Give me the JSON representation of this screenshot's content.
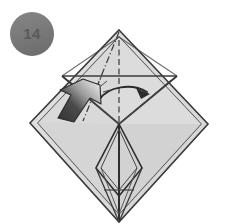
{
  "page": {
    "width": 228,
    "height": 224,
    "background_color": "#ffffff"
  },
  "step_badge": {
    "label": "14",
    "shape": "circle",
    "center_x": 32,
    "center_y": 34,
    "radius": 22,
    "fill_color": "#7b7b7b",
    "text_color": "#585858"
  },
  "figure": {
    "name": "origami-diamond-base",
    "paper_fill_light": "#dedede",
    "paper_fill_mid": "#d2d2d2",
    "paper_fill_shade": "#c9c9c9",
    "outline_color": "#3a3a3a",
    "crease_color": "#4a4a4a",
    "outer_diamond": {
      "top": [
        119,
        30
      ],
      "left": [
        30,
        123
      ],
      "right": [
        208,
        124
      ],
      "bottom": [
        119,
        222
      ]
    },
    "inner_diamond": {
      "top": [
        119,
        37
      ],
      "left": [
        38,
        123
      ],
      "right": [
        201,
        124
      ],
      "bottom": [
        119,
        214
      ]
    },
    "center_point": [
      119,
      124
    ],
    "horizontal_crease_y": 76,
    "horizontal_crease_x1": 62,
    "horizontal_crease_x2": 177
  },
  "annotations": {
    "valley_fold_line": {
      "name": "dash-dot-fold-line",
      "style": "dash-dot",
      "from": [
        119,
        32
      ],
      "to": [
        83,
        121
      ]
    },
    "center_fold_line": {
      "name": "dashed-center-line",
      "style": "dashed",
      "from": [
        119,
        40
      ],
      "to": [
        119,
        122
      ]
    },
    "curved_fold_arrow": {
      "name": "curved-fold-arrow",
      "direction": "left-to-right",
      "color": "#2f2f2f",
      "start": [
        100,
        98
      ],
      "end": [
        148,
        92
      ]
    },
    "push_arrow": {
      "name": "push-arrow",
      "direction": "up-right",
      "gradient_dark": "#3c3c3c",
      "gradient_light": "#e2e2e2",
      "tip": [
        100,
        88
      ],
      "tail": [
        58,
        124
      ]
    }
  }
}
